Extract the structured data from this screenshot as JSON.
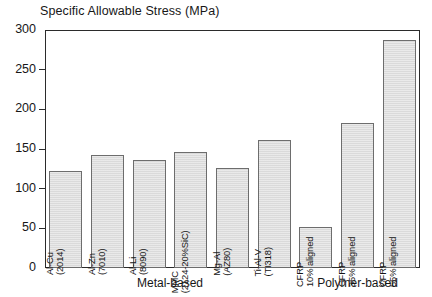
{
  "chart_data": {
    "type": "bar",
    "title": "Specific Allowable Stress (MPa)",
    "xlabel": "",
    "ylabel": "",
    "ylim": [
      0,
      300
    ],
    "yticks": [
      0,
      50,
      100,
      150,
      200,
      250,
      300
    ],
    "grid": false,
    "legend": "none",
    "categories": [
      "Al-Cu (2014)",
      "Al-Zn (7010)",
      "Al-Li (8090)",
      "MMC (2124-20%SiC)",
      "Mg-Al (AZ80)",
      "Ti-Al-V (TI318)",
      "CFRP 10% aligned",
      "CFRP 35% aligned",
      "CFRP 55% aligned"
    ],
    "values": [
      122,
      142,
      136,
      146,
      126,
      161,
      52,
      183,
      288
    ],
    "bars": [
      {
        "line1": "Al-Cu",
        "line2": "(2014)",
        "value": 122,
        "group": "Metal-based"
      },
      {
        "line1": "Al-Zn",
        "line2": "(7010)",
        "value": 142,
        "group": "Metal-based"
      },
      {
        "line1": "Al-Li",
        "line2": "(8090)",
        "value": 136,
        "group": "Metal-based"
      },
      {
        "line1": "MMC",
        "line2": "(2124-20%SiC)",
        "value": 146,
        "group": "Metal-based"
      },
      {
        "line1": "Mg-Al",
        "line2": "(AZ80)",
        "value": 126,
        "group": "Metal-based"
      },
      {
        "line1": "Ti-Al-V",
        "line2": "(TI318)",
        "value": 161,
        "group": "Metal-based"
      },
      {
        "line1": "CFRP",
        "line2": "10% aligned",
        "value": 52,
        "group": "Polymer-based"
      },
      {
        "line1": "CFRP",
        "line2": "35% aligned",
        "value": 183,
        "group": "Polymer-based"
      },
      {
        "line1": "CFRP",
        "line2": "55% aligned",
        "value": 288,
        "group": "Polymer-based"
      }
    ],
    "groups": [
      {
        "label": "Metal-based",
        "first": 0,
        "last": 5
      },
      {
        "label": "Polymer-based",
        "first": 6,
        "last": 8
      }
    ],
    "colors": {
      "bar_fill": "#dedede",
      "bar_border": "#6d6d6d",
      "axis": "#2b2b2b",
      "text": "#171717",
      "background": "#ffffff"
    }
  }
}
